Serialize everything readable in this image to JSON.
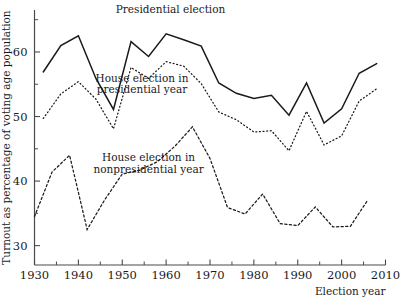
{
  "chart_data": {
    "type": "line",
    "title": "",
    "xlabel": "Election year",
    "ylabel": "Turnout as percentage of voting age population",
    "xlim": [
      1930,
      2010
    ],
    "ylim": [
      27,
      66.5
    ],
    "grid": false,
    "legend_position": "inline-annotations",
    "xticks": [
      1930,
      1940,
      1950,
      1960,
      1970,
      1980,
      1990,
      2000,
      2010
    ],
    "xtick_labels": [
      "1930",
      "1940",
      "1950",
      "1960",
      "1970",
      "1980",
      "1990",
      "2000",
      "2010"
    ],
    "xminor_ticks": [
      1935,
      1945,
      1955,
      1965,
      1975,
      1985,
      1995,
      2005
    ],
    "yticks": [
      30,
      40,
      50,
      60
    ],
    "ytick_labels": [
      "30",
      "40",
      "50",
      "60"
    ],
    "yminor_ticks": [
      35,
      45,
      55,
      65
    ],
    "annotations": [
      {
        "id": "presidential",
        "text": "Presidential election",
        "x": 1961,
        "y": 66.0
      },
      {
        "id": "house-presidential-l1",
        "text": "House election in",
        "x": 1954.5,
        "y": 55.4
      },
      {
        "id": "house-presidential-l2",
        "text": "presidential year",
        "x": 1954.5,
        "y": 53.6
      },
      {
        "id": "house-nonpresidential-l1",
        "text": "House election in",
        "x": 1956,
        "y": 43.1
      },
      {
        "id": "house-nonpresidential-l2",
        "text": "nonpresidential year",
        "x": 1956,
        "y": 41.3
      }
    ],
    "series": [
      {
        "name": "Presidential election",
        "style": "solid",
        "color": "#1a1a1a",
        "x": [
          1932,
          1936,
          1940,
          1944,
          1948,
          1952,
          1956,
          1960,
          1964,
          1968,
          1972,
          1976,
          1980,
          1984,
          1988,
          1992,
          1996,
          2000,
          2004,
          2008
        ],
        "values": [
          56.9,
          61.0,
          62.5,
          55.9,
          51.1,
          61.6,
          59.3,
          62.8,
          61.9,
          60.9,
          55.2,
          53.6,
          52.8,
          53.3,
          50.2,
          55.2,
          49.0,
          51.2,
          56.7,
          58.2
        ]
      },
      {
        "name": "House election in presidential year",
        "style": "dotted",
        "color": "#1a1a1a",
        "x": [
          1932,
          1936,
          1940,
          1944,
          1948,
          1952,
          1956,
          1960,
          1964,
          1968,
          1972,
          1976,
          1980,
          1984,
          1988,
          1992,
          1996,
          2000,
          2004,
          2008
        ],
        "values": [
          49.7,
          53.5,
          55.4,
          52.7,
          48.1,
          57.6,
          55.9,
          58.5,
          57.8,
          55.1,
          50.7,
          49.5,
          47.6,
          47.8,
          44.7,
          50.8,
          45.6,
          47.0,
          52.4,
          54.3
        ]
      },
      {
        "name": "House election in nonpresidential year",
        "style": "dashed",
        "color": "#1a1a1a",
        "x": [
          1930,
          1934,
          1938,
          1942,
          1946,
          1950,
          1954,
          1958,
          1962,
          1966,
          1970,
          1974,
          1978,
          1982,
          1986,
          1990,
          1994,
          1998,
          2002,
          2006
        ],
        "values": [
          34.5,
          41.4,
          44.0,
          32.5,
          37.1,
          41.1,
          41.7,
          43.0,
          45.4,
          48.4,
          43.5,
          35.9,
          34.9,
          38.0,
          33.4,
          33.1,
          36.0,
          32.9,
          33.0,
          37.1
        ]
      }
    ]
  },
  "axes": {
    "x_title": "Election year",
    "y_title": "Turnout as percentage of voting age population"
  }
}
